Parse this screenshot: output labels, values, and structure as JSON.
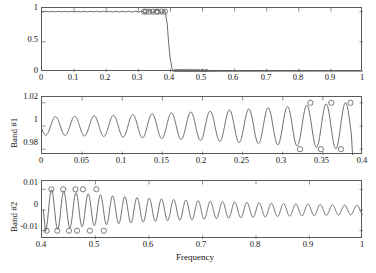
{
  "figure": {
    "title": "",
    "caption": "",
    "xlabel": "Frequency",
    "background": "#ffffff",
    "line_color": "#5a5a5a",
    "marker_color": "#6a6a6a",
    "axis_color": "#5a5a5a"
  },
  "chart_data": [
    {
      "id": "magnitude-response",
      "type": "line",
      "title": "",
      "xlabel": "",
      "ylabel": "",
      "xlim": [
        0,
        1
      ],
      "ylim": [
        0,
        1.06
      ],
      "grid": false,
      "legend": null,
      "xticks": [
        0,
        0.1,
        0.2,
        0.3,
        0.4,
        0.5,
        0.6,
        0.7,
        0.8,
        0.9,
        1
      ],
      "xticklabels": [
        "0",
        "0.1",
        "0.2",
        "0.3",
        "0.4",
        "0.5",
        "0.6",
        "0.7",
        "0.8",
        "0.9",
        "1"
      ],
      "yticks": [
        0,
        0.5,
        1
      ],
      "yticklabels": [
        "0",
        "0.5",
        "1"
      ],
      "description": "Lowpass filter magnitude response: passband ~1 from 0 to 0.385, sharp transition, stopband ~0 from 0.415 to 1",
      "series": [
        {
          "name": "magnitude",
          "x": [
            0,
            0.01,
            0.02,
            0.03,
            0.04,
            0.05,
            0.06,
            0.07,
            0.08,
            0.09,
            0.1,
            0.11,
            0.12,
            0.13,
            0.14,
            0.15,
            0.16,
            0.17,
            0.18,
            0.19,
            0.2,
            0.21,
            0.22,
            0.23,
            0.24,
            0.25,
            0.26,
            0.27,
            0.28,
            0.29,
            0.3,
            0.31,
            0.32,
            0.33,
            0.335,
            0.345,
            0.355,
            0.36,
            0.37,
            0.375,
            0.383,
            0.39,
            0.395,
            0.4,
            0.405,
            0.41,
            0.413,
            0.42,
            0.43,
            0.44,
            0.45,
            0.46,
            0.47,
            0.475,
            0.49,
            0.5,
            0.505,
            0.52,
            0.55,
            0.6,
            0.65,
            0.7,
            0.75,
            0.8,
            0.85,
            0.9,
            0.95,
            1.0
          ],
          "y": [
            0.993,
            1.005,
            0.997,
            1.004,
            0.996,
            1.005,
            0.996,
            1.005,
            0.996,
            1.005,
            0.996,
            1.005,
            0.996,
            1.005,
            0.996,
            1.005,
            0.995,
            1.006,
            0.995,
            1.006,
            0.995,
            1.006,
            0.994,
            1.007,
            0.994,
            1.007,
            0.993,
            1.008,
            0.992,
            1.009,
            0.991,
            1.01,
            0.98,
            1.02,
            1.02,
            0.98,
            1.02,
            1.02,
            0.98,
            0.98,
            1.02,
            0.8,
            0.45,
            0.2,
            0.06,
            0.012,
            0.01,
            0.01,
            0.01,
            0.01,
            0.01,
            0.01,
            0.01,
            0.01,
            0.01,
            0.01,
            0.008,
            0.006,
            0.005,
            0.004,
            0.004,
            0.003,
            0.003,
            0.003,
            0.002,
            0.002,
            0.002,
            0.002
          ]
        }
      ],
      "markers": {
        "passband_x": [
          0.318,
          0.324,
          0.334,
          0.345,
          0.356,
          0.361,
          0.372,
          0.383
        ],
        "passband_y": [
          1.0,
          1.0,
          1.0,
          1.0,
          1.0,
          1.0,
          1.0,
          1.0
        ],
        "stopband_x": [
          0.416,
          0.424,
          0.432,
          0.44,
          0.45,
          0.46,
          0.468,
          0.478,
          0.488,
          0.5,
          0.512
        ],
        "stopband_y": [
          0,
          0,
          0,
          0,
          0,
          0,
          0,
          0,
          0,
          0,
          0
        ]
      }
    },
    {
      "id": "band-1-passband-ripple",
      "type": "line",
      "title": "",
      "xlabel": "",
      "ylabel": "Band #1",
      "xlim": [
        0,
        0.4
      ],
      "ylim": [
        0.975,
        1.025
      ],
      "grid": false,
      "legend": null,
      "xticks": [
        0,
        0.05,
        0.1,
        0.15,
        0.2,
        0.25,
        0.3,
        0.35,
        0.4
      ],
      "xticklabels": [
        "0",
        "0.05",
        "0.1",
        "0.15",
        "0.2",
        "0.25",
        "0.3",
        "0.35",
        "0.4"
      ],
      "yticks": [
        0.98,
        1,
        1.02
      ],
      "yticklabels": [
        "0.98",
        "1",
        "1.02"
      ],
      "description": "Passband equiripple detail, ripple amplitude grows from ~0.008 near DC to 0.02 at band edge 0.385",
      "ripple": {
        "mean": 1.0,
        "amplitude_start": 0.008,
        "amplitude_end": 0.0205,
        "cycles": 16,
        "phase_deg": 200
      },
      "markers": {
        "peak_x": [
          0.3345,
          0.3605,
          0.3845
        ],
        "peak_y": [
          1.02,
          1.02,
          1.02
        ],
        "trough_x": [
          0.3215,
          0.3475,
          0.3725
        ],
        "trough_y": [
          0.98,
          0.98,
          0.98
        ]
      }
    },
    {
      "id": "band-2-stopband-ripple",
      "type": "line",
      "title": "",
      "xlabel": "Frequency",
      "ylabel": "Band #2",
      "xlim": [
        0.4,
        1.0
      ],
      "ylim": [
        -0.014,
        0.014
      ],
      "grid": false,
      "legend": null,
      "xticks": [
        0.4,
        0.5,
        0.6,
        0.7,
        0.8,
        0.9,
        1.0
      ],
      "xticklabels": [
        "0.4",
        "0.5",
        "0.6",
        "0.7",
        "0.8",
        "0.9",
        "1"
      ],
      "yticks": [
        -0.01,
        0,
        0.01
      ],
      "yticklabels": [
        "-0.01",
        "0",
        "0.01"
      ],
      "description": "Stopband equiripple detail, ripple amplitude decays from 0.01 at band edge 0.415 to ~0.002 at Nyquist",
      "ripple": {
        "mean": 0.0,
        "amplitude_start": 0.0103,
        "amplitude_end": 0.0022,
        "cycles": 26,
        "phase_deg": 270
      },
      "markers": {
        "peak_x": [
          0.4175,
          0.4395,
          0.4625,
          0.4765,
          0.5015
        ],
        "peak_y": [
          0.01,
          0.01,
          0.01,
          0.01,
          0.01
        ],
        "trough_x": [
          0.4085,
          0.4285,
          0.4505,
          0.4655,
          0.4895,
          0.5155
        ],
        "trough_y": [
          -0.01,
          -0.01,
          -0.01,
          -0.01,
          -0.01,
          -0.01
        ]
      }
    }
  ]
}
